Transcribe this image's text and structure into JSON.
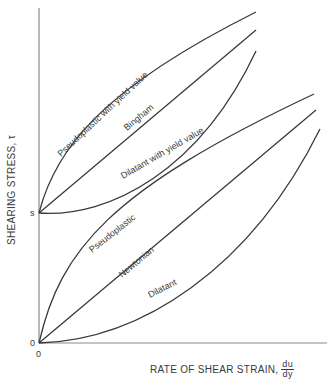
{
  "figure": {
    "y_axis_label": "SHEARING STRESS, τ",
    "x_axis_label": "RATE OF SHEAR STRAIN,",
    "x_axis_fraction": {
      "numerator": "du",
      "denominator": "dy"
    },
    "y_ticks": {
      "origin": "0",
      "yield": "s"
    },
    "x_ticks": {
      "origin": "0"
    },
    "colors": {
      "line": "#3a3a3a",
      "axis": "#8a8a8a",
      "background": "#ffffff"
    },
    "curves": [
      {
        "id": "pseudoplastic-yield",
        "label": "Pseudoplastic with yield value",
        "start": "s"
      },
      {
        "id": "bingham",
        "label": "Bingham",
        "start": "s"
      },
      {
        "id": "dilatant-yield",
        "label": "Dilatant with yield value",
        "start": "s"
      },
      {
        "id": "pseudoplastic",
        "label": "Pseudoplastic",
        "start": "0"
      },
      {
        "id": "newtonian",
        "label": "Newtonian",
        "start": "0"
      },
      {
        "id": "dilatant",
        "label": "Dilatant",
        "start": "0"
      }
    ]
  }
}
